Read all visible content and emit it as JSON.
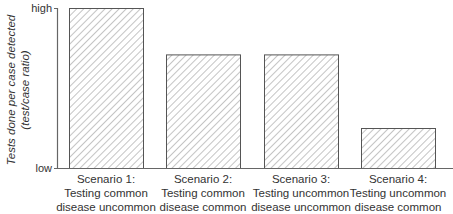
{
  "chart_data": {
    "type": "bar",
    "title": "",
    "xlabel": "",
    "ylabel": "Tests done per case detected",
    "ylabel_sub": "(test/case ratio)",
    "yticks": [
      "low",
      "high"
    ],
    "ylim": [
      0,
      1
    ],
    "grid": false,
    "legend": null,
    "categories": [
      [
        "Scenario 1:",
        "Testing common",
        "disease uncommon"
      ],
      [
        "Scenario 2:",
        "Testing common",
        "disease common"
      ],
      [
        "Scenario 3:",
        "Testing uncommon",
        "disease uncommon"
      ],
      [
        "Scenario 4:",
        "Testing uncommon",
        "disease common"
      ]
    ],
    "values": [
      1.0,
      0.71,
      0.71,
      0.25
    ],
    "bar_style": "diagonal-hatch",
    "colors": {
      "bar_outline": "#555555",
      "hatch": "#8a8a8a",
      "axis": "#666666"
    }
  }
}
